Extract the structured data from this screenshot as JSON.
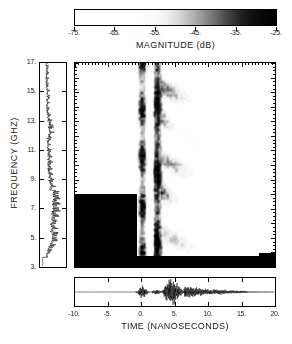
{
  "figure": {
    "kind": "joint-time-frequency-spectrogram"
  },
  "colorbar": {
    "title": "MAGNITUDE  (dB)",
    "min": -75,
    "max": -25,
    "ticks": [
      -75,
      -65,
      -55,
      -45,
      -35,
      -25
    ],
    "tick_labels": [
      "-75.",
      "-65.",
      "-55.",
      "-45.",
      "-35.",
      "-25."
    ],
    "colormap": "grayscale-inverted",
    "low_color": "#ffffff",
    "high_color": "#000000"
  },
  "axes": {
    "frequency": {
      "title": "FREQUENCY (GHZ)",
      "unit": "GHz",
      "min": 3,
      "max": 17,
      "ticks": [
        3,
        5,
        7,
        9,
        11,
        13,
        15,
        17
      ],
      "tick_labels": [
        "3.",
        "5.",
        "7.",
        "9.",
        "11.",
        "13.",
        "15.",
        "17."
      ]
    },
    "time": {
      "title": "TIME  (NANOSECONDS)",
      "unit": "ns",
      "min": -10,
      "max": 20,
      "ticks": [
        -10,
        -5,
        0,
        5,
        10,
        15,
        20
      ],
      "tick_labels": [
        "-10.",
        "-5.",
        "0.",
        "5.",
        "10.",
        "15.",
        "20."
      ]
    }
  },
  "chart_data": {
    "type": "heatmap",
    "title": "",
    "xlabel": "TIME  (NANOSECONDS)",
    "ylabel": "FREQUENCY (GHZ)",
    "xlim": [
      -10,
      20
    ],
    "ylim": [
      3,
      17
    ],
    "zlabel": "MAGNITUDE  (dB)",
    "zlim": [
      -75,
      -25
    ],
    "grid": false,
    "legend": "colorbar-top",
    "colormap": "gray-inverted",
    "features": [
      {
        "name": "quiet-precursor",
        "time_range": [
          -10,
          -2
        ],
        "frequency_range": [
          3,
          17
        ],
        "level_db": -72
      },
      {
        "name": "first-return-band",
        "time_center": 0.2,
        "time_width": 1.6,
        "frequency_range": [
          3,
          17
        ],
        "level_db": -30
      },
      {
        "name": "second-return-band",
        "time_center": 2.3,
        "time_width": 1.3,
        "frequency_range": [
          3,
          17
        ],
        "level_db": -27
      },
      {
        "name": "dispersive-fringe-tail",
        "time_range": [
          3.5,
          16
        ],
        "frequency_range": [
          3,
          16
        ],
        "level_db": -38
      },
      {
        "name": "decay-region",
        "time_range": [
          16,
          20
        ],
        "frequency_range": [
          3,
          17
        ],
        "level_db": -66
      }
    ],
    "side_panel_spectrum": {
      "name": "frequency-magnitude-spectrum",
      "orientation": "vertical",
      "axis": "frequency",
      "range": [
        3,
        17
      ],
      "note": "Magnitude versus frequency; densely oscillating with the largest excursions between 4 and 8 GHz and reduced amplitude above 11 GHz."
    },
    "bottom_panel_waveform": {
      "name": "time-domain-waveform",
      "orientation": "horizontal",
      "axis": "time",
      "range": [
        -10,
        20
      ],
      "note": "Received time-domain signal; small burst near t=0, dominant burst at t=3.5 to 6 ns, then slow ringdown through t=20 ns."
    }
  }
}
